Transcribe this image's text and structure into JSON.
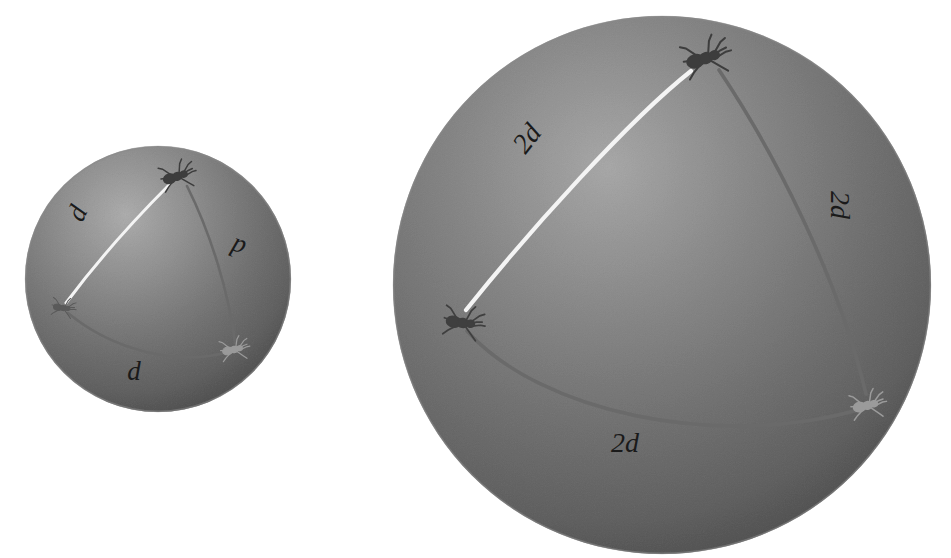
{
  "figure": {
    "background_color": "#ffffff",
    "sphere_base_color": "#a8a8a8",
    "sphere_highlight_color": "#cfcfcf",
    "sphere_shadow_color": "#8f8f8f",
    "ant_color": "#3a3a3a",
    "arc_dark_color": "#6d6d6d",
    "arc_light_color": "#f2f2f2"
  },
  "spheres": [
    {
      "id": "small-sphere",
      "name": "small-sphere",
      "cx": 158,
      "cy": 279,
      "r": 133,
      "label_scale": "d",
      "ants": [
        {
          "id": "ant-top",
          "name": "ant-top",
          "x": 176,
          "y": 177,
          "rotation": -15,
          "scale": 1.0,
          "shade": "#3d3d3d"
        },
        {
          "id": "ant-left",
          "name": "ant-left",
          "x": 62,
          "y": 308,
          "rotation": 10,
          "scale": 0.68,
          "shade": "#5a5a5a"
        },
        {
          "id": "ant-right",
          "name": "ant-right",
          "x": 233,
          "y": 350,
          "rotation": -10,
          "scale": 0.82,
          "shade": "#9a9a9a"
        }
      ],
      "arcs": [
        {
          "id": "arc-top-left",
          "name": "arc-light-top-left",
          "color": "#f4f4f4",
          "width": 3.0,
          "d": "M 170 184 C 140 214 98 260 66 303"
        },
        {
          "id": "arc-top-right",
          "name": "arc-dark-top-right",
          "color": "#6a6a6a",
          "width": 2.6,
          "d": "M 187 186 C 210 232 229 292 235 343"
        },
        {
          "id": "arc-left-right",
          "name": "arc-dark-bottom",
          "color": "#6a6a6a",
          "width": 2.6,
          "d": "M 68 313 C 110 348 174 367 228 352"
        }
      ],
      "labels": [
        {
          "id": "label-left",
          "name": "arc-label-left",
          "text": "d",
          "x": 85,
          "y": 217,
          "rotation": -65,
          "size": 27
        },
        {
          "id": "label-right",
          "name": "arc-label-right",
          "text": "d",
          "x": 241,
          "y": 240,
          "rotation": 200,
          "size": 27
        },
        {
          "id": "label-bottom",
          "name": "arc-label-bottom",
          "text": "d",
          "x": 134,
          "y": 380,
          "rotation": 0,
          "size": 27
        }
      ]
    },
    {
      "id": "large-sphere",
      "name": "large-sphere",
      "cx": 662,
      "cy": 285,
      "r": 269,
      "label_scale": "2d",
      "ants": [
        {
          "id": "ant-top",
          "name": "ant-top",
          "x": 704,
          "y": 59,
          "rotation": -15,
          "scale": 1.35,
          "shade": "#3d3d3d"
        },
        {
          "id": "ant-left",
          "name": "ant-left",
          "x": 461,
          "y": 323,
          "rotation": 10,
          "scale": 1.15,
          "shade": "#3f3f3f"
        },
        {
          "id": "ant-right",
          "name": "ant-right",
          "x": 866,
          "y": 406,
          "rotation": -10,
          "scale": 1.0,
          "shade": "#9b9b9b"
        }
      ],
      "arcs": [
        {
          "id": "arc-top-left",
          "name": "arc-light-top-left",
          "color": "#f4f4f4",
          "width": 4.2,
          "d": "M 691 71 C 629 120 530 230 466 310"
        },
        {
          "id": "arc-top-right",
          "name": "arc-dark-top-right",
          "color": "#6a6a6a",
          "width": 3.6,
          "d": "M 719 70 C 774 152 838 276 866 394"
        },
        {
          "id": "arc-left-right",
          "name": "arc-dark-bottom",
          "color": "#6a6a6a",
          "width": 3.6,
          "d": "M 467 331 C 540 412 716 450 858 410"
        }
      ],
      "labels": [
        {
          "id": "label-left",
          "name": "arc-label-left",
          "text": "2d",
          "x": 534,
          "y": 144,
          "rotation": -52,
          "size": 28
        },
        {
          "id": "label-right",
          "name": "arc-label-right",
          "text": "2d",
          "x": 831,
          "y": 205,
          "rotation": 90,
          "size": 28
        },
        {
          "id": "label-bottom",
          "name": "arc-label-bottom",
          "text": "2d",
          "x": 625,
          "y": 452,
          "rotation": 0,
          "size": 28
        }
      ]
    }
  ]
}
